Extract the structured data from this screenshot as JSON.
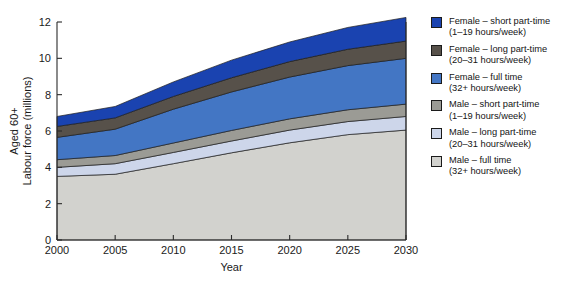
{
  "chart_data": {
    "type": "area",
    "stacked": true,
    "title": "",
    "xlabel": "Year",
    "ylabel": "Aged 60+\nLabour force (millions)",
    "ylabel_lines": [
      "Aged 60+",
      "Labour force (millions)"
    ],
    "x": [
      2000,
      2005,
      2010,
      2015,
      2020,
      2025,
      2030
    ],
    "xlim": [
      2000,
      2030
    ],
    "ylim": [
      0,
      12
    ],
    "xticks": [
      2000,
      2005,
      2010,
      2015,
      2020,
      2025,
      2030
    ],
    "xtick_labels": [
      "2000",
      "2005",
      "2010",
      "2015",
      "2020",
      "2025",
      "2030"
    ],
    "yticks": [
      0,
      2,
      4,
      6,
      8,
      10,
      12
    ],
    "ytick_labels": [
      "0",
      "2",
      "4",
      "6",
      "8",
      "10",
      "12"
    ],
    "grid": false,
    "legend_position": "right-outside",
    "series": [
      {
        "name": "Male – full time",
        "detail": "(32+ hours/week)",
        "color": "#d2d2ce",
        "values": [
          3.5,
          3.62,
          4.2,
          4.8,
          5.35,
          5.8,
          6.05
        ]
      },
      {
        "name": "Male – long part-time",
        "detail": "(20–31 hours/week)",
        "color": "#cdd6ea",
        "values": [
          0.5,
          0.58,
          0.62,
          0.65,
          0.7,
          0.72,
          0.75
        ]
      },
      {
        "name": "Male – short part-time",
        "detail": "(1–19 hours/week)",
        "color": "#9b9b95",
        "values": [
          0.42,
          0.45,
          0.52,
          0.58,
          0.62,
          0.65,
          0.68
        ]
      },
      {
        "name": "Female – full time",
        "detail": "(32+ hours/week)",
        "color": "#4376c4",
        "values": [
          1.23,
          1.45,
          1.86,
          2.12,
          2.3,
          2.43,
          2.52
        ]
      },
      {
        "name": "Female – long part-time",
        "detail": "(20–31 hours/week)",
        "color": "#57514a",
        "values": [
          0.6,
          0.62,
          0.7,
          0.78,
          0.85,
          0.9,
          0.95
        ]
      },
      {
        "name": "Female – short part-time",
        "detail": "(1–19 hours/week)",
        "color": "#1a43b0",
        "values": [
          0.55,
          0.63,
          0.8,
          0.97,
          1.08,
          1.2,
          1.3
        ]
      }
    ],
    "stack_tops": {
      "male_full_time": [
        3.5,
        3.62,
        4.2,
        4.8,
        5.35,
        5.8,
        6.05
      ],
      "male_long_part_time": [
        4.0,
        4.2,
        4.82,
        5.45,
        6.05,
        6.52,
        6.8
      ],
      "male_short_part_time": [
        4.42,
        4.65,
        5.34,
        6.03,
        6.67,
        7.17,
        7.48
      ],
      "female_full_time": [
        5.65,
        6.1,
        7.2,
        8.15,
        8.97,
        9.6,
        10.0
      ],
      "female_long_part_time": [
        6.25,
        6.72,
        7.9,
        8.93,
        9.82,
        10.5,
        10.95
      ],
      "female_short_part_time": [
        6.8,
        7.35,
        8.7,
        9.9,
        10.9,
        11.7,
        12.25
      ]
    }
  },
  "legend": {
    "items": [
      {
        "label": "Female – short part-time",
        "sublabel": "(1–19 hours/week)",
        "color": "#1a43b0",
        "name": "legend-item-female-short-part-time"
      },
      {
        "label": "Female – long part-time",
        "sublabel": "(20–31 hours/week)",
        "color": "#57514a",
        "name": "legend-item-female-long-part-time"
      },
      {
        "label": "Female – full time",
        "sublabel": "(32+ hours/week)",
        "color": "#4376c4",
        "name": "legend-item-female-full-time"
      },
      {
        "label": "Male – short part-time",
        "sublabel": "(1–19 hours/week)",
        "color": "#9b9b95",
        "name": "legend-item-male-short-part-time"
      },
      {
        "label": "Male – long part-time",
        "sublabel": "(20–31 hours/week)",
        "color": "#cdd6ea",
        "name": "legend-item-male-long-part-time"
      },
      {
        "label": "Male – full time",
        "sublabel": "(32+ hours/week)",
        "color": "#d2d2ce",
        "name": "legend-item-male-full-time"
      }
    ]
  }
}
